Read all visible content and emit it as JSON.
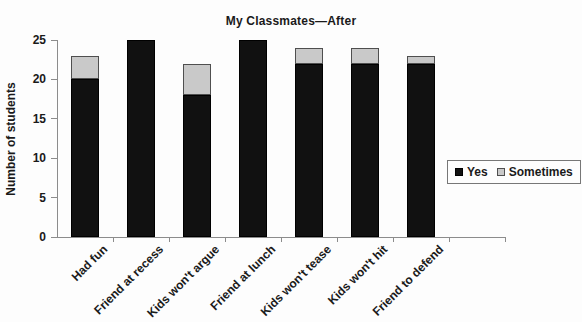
{
  "chart_data": {
    "type": "bar",
    "stacked": true,
    "title": "My Classmates—After",
    "xlabel": "",
    "ylabel": "Number of students",
    "ylim": [
      0,
      25
    ],
    "ytick_step": 5,
    "grid": false,
    "legend_position": "middle-right",
    "categories": [
      "Had fun",
      "Friend at recess",
      "Kids won't argue",
      "Friend at lunch",
      "Kids won't tease",
      "Kids won't hit",
      "Friend to defend"
    ],
    "series": [
      {
        "name": "Yes",
        "color": "#111111",
        "border": "#000000",
        "values": [
          20,
          25,
          18,
          25,
          22,
          22,
          22
        ]
      },
      {
        "name": "Sometimes",
        "color": "#c9c9c9",
        "border": "#4f4f4f",
        "values": [
          3,
          0,
          4,
          0,
          2,
          2,
          1
        ]
      }
    ],
    "ytick_labels": [
      "0",
      "5",
      "10",
      "15",
      "20",
      "25"
    ]
  },
  "colors": {
    "axis": "#8c8c8c",
    "background": "#fdfdfd",
    "text": "#1a1a1a",
    "legend_border": "#777777"
  }
}
